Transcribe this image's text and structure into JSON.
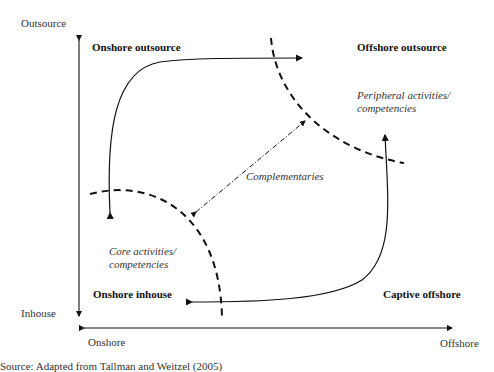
{
  "axes": {
    "y_top": "Outsource",
    "y_bottom": "Inhouse",
    "x_left": "Onshore",
    "x_right": "Offshore"
  },
  "quadrants": {
    "top_left": "Onshore outsource",
    "top_right": "Offshore outsource",
    "bottom_left": "Onshore inhouse",
    "bottom_right": "Captive offshore"
  },
  "annotations": {
    "peripheral_line1": "Peripheral activities/",
    "peripheral_line2": "competencies",
    "core_line1": "Core activities/",
    "core_line2": "competencies",
    "complementaries": "Complementaries"
  },
  "caption": "Source: Adapted from Tallman and Weitzel (2005)",
  "colors": {
    "line": "#111111",
    "text": "#222222"
  }
}
